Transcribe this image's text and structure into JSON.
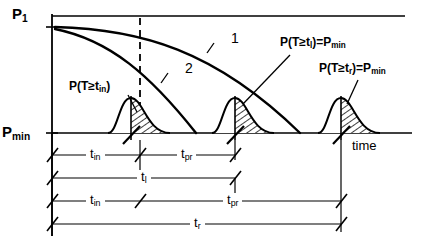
{
  "diagram": {
    "type": "reliability-probability-diagram",
    "axes": {
      "y_top_label": "P",
      "y_top_sub": "1",
      "y_bottom_label": "P",
      "y_bottom_sub": "min",
      "x_label": "time"
    },
    "curves": [
      {
        "id": "curve-1",
        "label": "1",
        "description": "upper shallow decay curve"
      },
      {
        "id": "curve-2",
        "label": "2",
        "description": "lower steep decay curve"
      }
    ],
    "annotations": [
      {
        "id": "annotation-tin",
        "text_parts": {
          "pre": "P(T≥t",
          "sub": "in",
          "post": ")"
        },
        "full": "P(T≥t_in)"
      },
      {
        "id": "annotation-tl",
        "text_parts": {
          "pre": "P(T≥t",
          "sub": "l",
          "post": ")=P",
          "sub2": "min"
        },
        "full": "P(T≥t_l)=P_min"
      },
      {
        "id": "annotation-tr",
        "text_parts": {
          "pre": "P(T≥t",
          "sub": "r",
          "post": ")=P",
          "sub2": "min"
        },
        "full": "P(T≥t_r)=P_min"
      }
    ],
    "distributions": [
      {
        "id": "bell-1",
        "hatched": true
      },
      {
        "id": "bell-2",
        "hatched": true
      },
      {
        "id": "bell-3",
        "hatched": true
      }
    ],
    "dimension_rows": [
      {
        "id": "dim-row-1",
        "segments": [
          {
            "label_pre": "t",
            "label_sub": "in"
          },
          {
            "label_pre": "t",
            "label_sub": "pr"
          }
        ]
      },
      {
        "id": "dim-row-2",
        "segments": [
          {
            "label_pre": "t",
            "label_sub": "l"
          }
        ]
      },
      {
        "id": "dim-row-3",
        "segments": [
          {
            "label_pre": "t",
            "label_sub": "in"
          },
          {
            "label_pre": "t",
            "label_sub": "pr"
          }
        ]
      },
      {
        "id": "dim-row-4",
        "segments": [
          {
            "label_pre": "t",
            "label_sub": "r"
          }
        ]
      }
    ],
    "colors": {
      "line": "#000000",
      "background": "#ffffff",
      "thin_line": "#1a1a1a"
    }
  }
}
